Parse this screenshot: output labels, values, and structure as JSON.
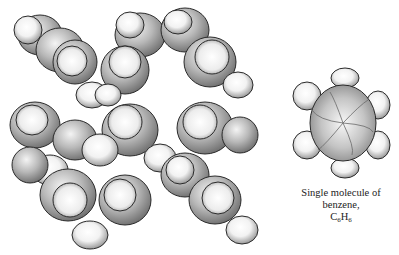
{
  "figure": {
    "colors": {
      "outline": "#2a2a2a",
      "atom_light": "#ffffff",
      "atom_shade": "#8a8a8a",
      "background": "#ffffff"
    }
  },
  "caption": {
    "line1": "Single molecule of",
    "line2": "benzene,",
    "formula_c": "C",
    "formula_c_sub": "6",
    "formula_h": "H",
    "formula_h_sub": "6"
  }
}
